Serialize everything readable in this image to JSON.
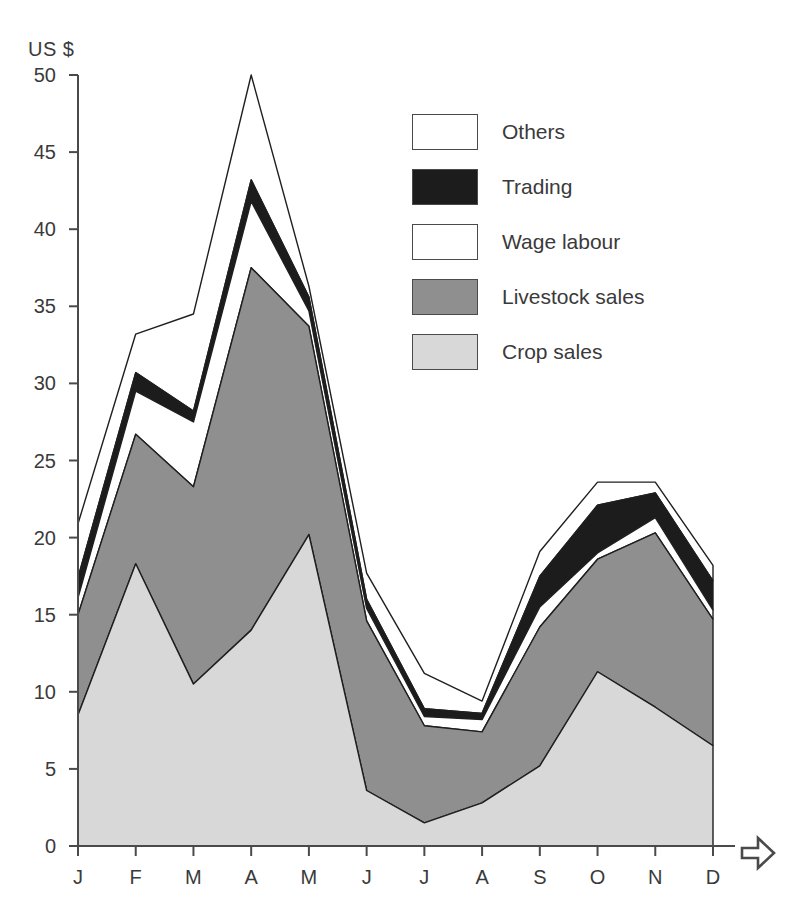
{
  "chart_data": {
    "type": "area",
    "stacked": true,
    "title": "",
    "subtitle": "",
    "xlabel": "",
    "ylabel": "US $",
    "yunit_label": "US $",
    "ylim": [
      0,
      50
    ],
    "ytick_labels": [
      "0",
      "5",
      "10",
      "15",
      "20",
      "25",
      "30",
      "35",
      "40",
      "45",
      "50"
    ],
    "ytick_values": [
      0,
      5,
      10,
      15,
      20,
      25,
      30,
      35,
      40,
      45,
      50
    ],
    "grid": false,
    "x_axis_arrow": true,
    "categories": [
      "J",
      "F",
      "M",
      "A",
      "M",
      "J",
      "J",
      "A",
      "S",
      "O",
      "N",
      "D"
    ],
    "category_names": [
      "January",
      "February",
      "March",
      "April",
      "May",
      "June",
      "July",
      "August",
      "September",
      "October",
      "November",
      "December"
    ],
    "legend_position": "upper-right",
    "series": [
      {
        "name": "Crop sales",
        "color": "#d8d8d8",
        "values": [
          8.5,
          18.3,
          10.5,
          14.0,
          20.2,
          3.6,
          1.5,
          2.8,
          5.2,
          11.3,
          9.0,
          6.5
        ]
      },
      {
        "name": "Livestock sales",
        "color": "#8f8f8f",
        "values": [
          6.5,
          8.4,
          12.8,
          23.5,
          13.5,
          11.0,
          6.3,
          4.6,
          9.0,
          7.3,
          11.3,
          8.2
        ]
      },
      {
        "name": "Wage labour",
        "color": "#ffffff",
        "values": [
          1.1,
          2.8,
          4.2,
          4.3,
          1.0,
          0.8,
          0.6,
          0.8,
          1.3,
          0.4,
          1.0,
          0.6
        ]
      },
      {
        "name": "Trading",
        "color": "#1c1c1c",
        "values": [
          1.3,
          1.2,
          0.7,
          1.4,
          0.9,
          0.6,
          0.5,
          0.4,
          2.0,
          3.1,
          1.6,
          1.9
        ]
      },
      {
        "name": "Others",
        "color": "#ffffff",
        "values": [
          2.5,
          2.5,
          6.3,
          6.8,
          0.7,
          1.7,
          2.3,
          0.8,
          1.6,
          1.5,
          0.7,
          1.0
        ]
      }
    ],
    "cumulative_tops": {
      "Crop sales": [
        8.5,
        18.3,
        10.5,
        14.0,
        20.2,
        3.6,
        1.5,
        2.8,
        5.2,
        11.3,
        9.0,
        6.5
      ],
      "Livestock sales": [
        15.0,
        26.7,
        23.3,
        37.5,
        33.7,
        14.6,
        7.8,
        7.4,
        14.2,
        18.6,
        20.3,
        14.7
      ],
      "Wage labour": [
        16.1,
        29.5,
        27.5,
        41.8,
        34.7,
        15.4,
        8.4,
        8.2,
        15.5,
        19.0,
        21.3,
        15.3
      ],
      "Trading": [
        17.4,
        30.7,
        28.2,
        43.2,
        35.6,
        16.0,
        8.9,
        8.6,
        17.5,
        22.1,
        22.9,
        17.2
      ],
      "Others": [
        20.9,
        33.2,
        34.5,
        50.0,
        36.3,
        17.7,
        11.2,
        9.4,
        19.1,
        23.6,
        23.6,
        18.2
      ]
    }
  },
  "axis": {
    "unit_label": "US $"
  },
  "legend": {
    "entries": [
      {
        "label": "Others",
        "swatch": "#ffffff"
      },
      {
        "label": "Trading",
        "swatch": "#1c1c1c"
      },
      {
        "label": "Wage labour",
        "swatch": "#ffffff"
      },
      {
        "label": "Livestock sales",
        "swatch": "#8f8f8f"
      },
      {
        "label": "Crop sales",
        "swatch": "#d8d8d8"
      }
    ]
  }
}
